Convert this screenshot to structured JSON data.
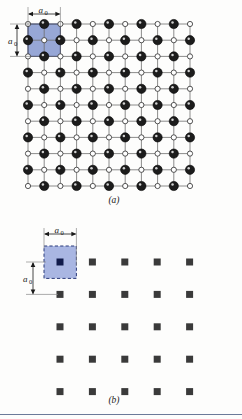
{
  "figure": {
    "background_color": "#fdfdfc",
    "rule_color": "#6b7a99"
  },
  "panels": [
    {
      "id": "a",
      "caption": "(a)",
      "description": "Square lattice of alternating open and filled ions with bonds drawn between nearest neighbours; one unit cell is shaded blue.",
      "unit_cell": {
        "fill_color": "#97a7d6",
        "border_color": "#2b3a7a",
        "border_style": "solid",
        "width_label": "a",
        "width_subscript": "0",
        "height_label": "a",
        "height_subscript": "0"
      },
      "lattice": {
        "columns": 11,
        "rows": 11,
        "spacing_px": 16.2,
        "origin_x": 28,
        "origin_y": 24,
        "bond_color": "#6e6e6e",
        "open_circle": {
          "name": "open-ion",
          "radius": 2.6,
          "fill": "#ffffff",
          "stroke": "#2a2a2a"
        },
        "filled_circle": {
          "name": "filled-ion",
          "radius": 4.6,
          "fill": "#1c1c1c",
          "stroke": "#000000",
          "highlight": "#f2f2f2"
        }
      }
    },
    {
      "id": "b",
      "caption": "(b)",
      "description": "The same lattice reduced to a square array of lattice points; one unit cell is shaded blue with a dashed outline.",
      "unit_cell": {
        "fill_color": "#a9b6e2",
        "border_color": "#2b3a7a",
        "border_style": "dashed",
        "width_label": "a",
        "width_subscript": "0",
        "height_label": "a",
        "height_subscript": "0"
      },
      "lattice": {
        "columns": 5,
        "rows": 5,
        "spacing_px": 32.4,
        "origin_x": 60,
        "origin_y": 262,
        "point": {
          "name": "lattice-point",
          "size": 7,
          "fill": "#3a3a3a"
        },
        "origin_point": {
          "name": "lattice-point-origin",
          "size": 7,
          "fill": "#101a4a"
        }
      }
    }
  ],
  "annotations": {
    "a0_symbol": "a",
    "a0_subscript": "0",
    "caption_a": "(a)",
    "caption_b": "(b)"
  },
  "chart_data": {
    "type": "scatter",
    "xlabel": "",
    "ylabel": "",
    "panels": [
      {
        "name": "(a)",
        "kind": "ionic-lattice",
        "grid_columns": 11,
        "grid_rows": 11,
        "site_types": [
          "open-ion",
          "filled-ion"
        ],
        "pattern": "checkerboard-alternating",
        "unit_cell_side_in_spacings": 2,
        "unit_cell_label": "a0"
      },
      {
        "name": "(b)",
        "kind": "lattice-points",
        "grid_columns": 5,
        "grid_rows": 5,
        "site_types": [
          "lattice-point"
        ],
        "unit_cell_side_in_spacings": 1,
        "unit_cell_label": "a0"
      }
    ]
  }
}
